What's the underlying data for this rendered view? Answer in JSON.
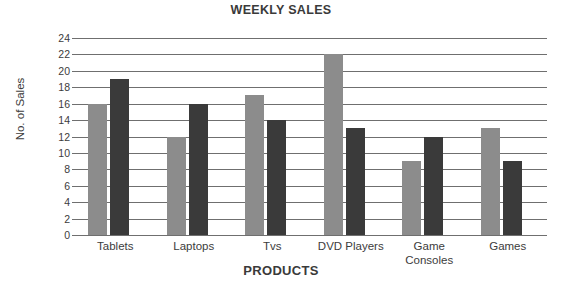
{
  "chart_data": {
    "type": "bar",
    "title": "WEEKLY SALES",
    "xlabel": "PRODUCTS",
    "ylabel": "No. of Sales",
    "categories": [
      "Tablets",
      "Laptops",
      "Tvs",
      "DVD Players",
      "Game Consoles",
      "Games"
    ],
    "series": [
      {
        "name": "Series 1",
        "color": "#8c8c8c",
        "values": [
          16,
          12,
          17,
          22,
          9,
          13
        ]
      },
      {
        "name": "Series 2",
        "color": "#3a3a3a",
        "values": [
          19,
          16,
          14,
          13,
          12,
          9
        ]
      }
    ],
    "ylim": [
      0,
      24
    ],
    "ytick_step": 2,
    "yticks": [
      0,
      2,
      4,
      6,
      8,
      10,
      12,
      14,
      16,
      18,
      20,
      22,
      24
    ],
    "ytick_labels": [
      "0",
      "2",
      "4",
      "6",
      "8",
      "10",
      "12",
      "14",
      "16",
      "18",
      "20",
      "22",
      "24"
    ],
    "grid": true,
    "grid_axis": "y",
    "legend": "none",
    "legend_position": "none",
    "gridline_color": "#6f6f6f",
    "background": "#ffffff",
    "text_color": "#3c3c3c"
  }
}
